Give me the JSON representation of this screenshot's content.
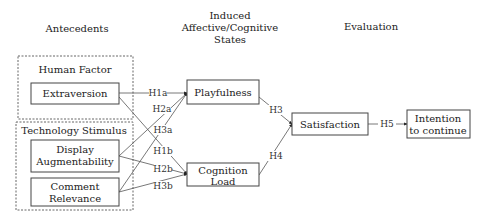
{
  "headers": {
    "antecedents": "Antecedents",
    "induced": [
      "Induced",
      "Affective/Cognitive",
      "States"
    ],
    "evaluation": "Evaluation"
  },
  "groups": {
    "human_factor": "Human Factor",
    "technology_stimulus": "Technology Stimulus"
  },
  "nodes": {
    "extraversion": [
      "Extraversion"
    ],
    "display": [
      "Display",
      "Augmentability"
    ],
    "comment": [
      "Comment",
      "Relevance"
    ],
    "playfulness": [
      "Playfulness"
    ],
    "cognition": [
      "Cognition",
      "Load"
    ],
    "satisfaction": [
      "Satisfaction"
    ],
    "intention": [
      "Intention",
      "to continue"
    ]
  },
  "hypotheses": [
    {
      "id": "H1a",
      "from": "extraversion",
      "to": "playfulness"
    },
    {
      "id": "H2a",
      "from": "display",
      "to": "playfulness"
    },
    {
      "id": "H3a",
      "from": "comment",
      "to": "playfulness"
    },
    {
      "id": "H1b",
      "from": "extraversion",
      "to": "cognition"
    },
    {
      "id": "H2b",
      "from": "display",
      "to": "cognition"
    },
    {
      "id": "H3b",
      "from": "comment",
      "to": "cognition"
    },
    {
      "id": "H3",
      "from": "playfulness",
      "to": "satisfaction"
    },
    {
      "id": "H4",
      "from": "cognition",
      "to": "satisfaction"
    },
    {
      "id": "H5",
      "from": "satisfaction",
      "to": "intention"
    }
  ],
  "colors": {
    "line": "#555555",
    "text": "#222222",
    "background": "#ffffff"
  }
}
